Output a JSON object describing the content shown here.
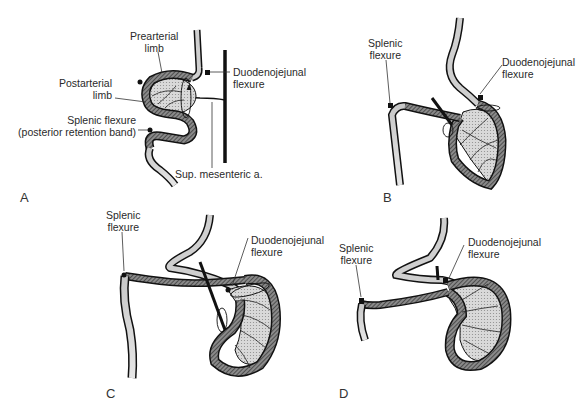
{
  "figure": {
    "panels": [
      {
        "letter": "A",
        "labels": {
          "prearterial_limb": [
            "Prearterial",
            "limb"
          ],
          "postarterial_limb": [
            "Postarterial",
            "limb"
          ],
          "duodenojejunal_flexure": [
            "Duodenojejunal",
            "flexure"
          ],
          "splenic_flexure": [
            "Splenic flexure",
            "(posterior retention band)"
          ],
          "sup_mesenteric_a": "Sup. mesenteric a."
        }
      },
      {
        "letter": "B",
        "labels": {
          "splenic_flexure": [
            "Splenic",
            "flexure"
          ],
          "duodenojejunal_flexure": [
            "Duodenojejunal",
            "flexure"
          ]
        }
      },
      {
        "letter": "C",
        "labels": {
          "splenic_flexure": [
            "Splenic",
            "flexure"
          ],
          "duodenojejunal_flexure": [
            "Duodenojejunal",
            "flexure"
          ]
        }
      },
      {
        "letter": "D",
        "labels": {
          "splenic_flexure": [
            "Splenic",
            "flexure"
          ],
          "duodenojejunal_flexure": [
            "Duodenojejunal",
            "flexure"
          ]
        }
      }
    ],
    "colors": {
      "outline": "#1a1a1a",
      "colon_fill": "#bdbdbd",
      "hatch": "#555555",
      "mesentery_fill": "#d6d6d6"
    }
  }
}
